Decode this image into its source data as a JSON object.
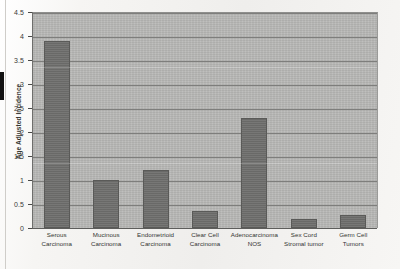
{
  "chart_data": {
    "type": "bar",
    "title": "",
    "xlabel": "",
    "ylabel": "Age Adjusted Incidence",
    "ylim": [
      0,
      4.5
    ],
    "yticks": [
      "0",
      "0.5",
      "1",
      "1.5",
      "2",
      "2.5",
      "3",
      "3.5",
      "4",
      "4.5"
    ],
    "ytick_values": [
      0,
      0.5,
      1,
      1.5,
      2,
      2.5,
      3,
      3.5,
      4,
      4.5
    ],
    "grid": "horizontal",
    "legend": "none",
    "categories": [
      "Serous Carcinoma",
      "Mucinous Carcinoma",
      "Endometrioid Carcinoma",
      "Clear Cell Carcinoma",
      "Adenocarcinoma NOS",
      "Sex Cord Stromal tumor",
      "Germ Cell Tumors"
    ],
    "values": [
      3.9,
      1.0,
      1.2,
      0.35,
      2.3,
      0.18,
      0.28
    ],
    "colors": {
      "bar_fill": "#6f6f6d",
      "bar_edge": "#5a5a58",
      "plot_background": "#b9b9b7",
      "gridline": "#7e7e7c",
      "page_background": "#f2f1ef",
      "text": "#333331"
    }
  }
}
